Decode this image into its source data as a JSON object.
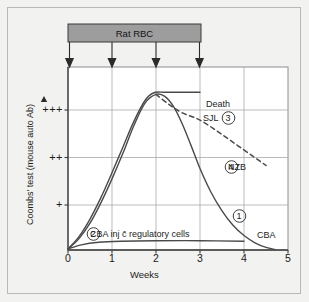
{
  "figure": {
    "background_color": "#f2f2f0",
    "border_color": "#b8b8b6",
    "line_color": "#4a4a4a",
    "grid_color": "#a9a9a9",
    "bar_fill": "#9d9d9d",
    "bar_stroke": "#3a3a3a"
  },
  "treatment_bar": {
    "label": "Rat RBC",
    "start_week": 0,
    "end_week": 3,
    "arrow_weeks": [
      0,
      1,
      2,
      3
    ],
    "arrow_count": 4
  },
  "axes": {
    "y_title": "Coombs' test (mouse auto Ab)",
    "y_arrow_icon": "up-arrow-icon",
    "y_ticks": [
      "+++",
      "++",
      "+"
    ],
    "y_tick_values": [
      3,
      2,
      1
    ],
    "x_title": "Weeks",
    "x_ticks": [
      "0",
      "1",
      "2",
      "3",
      "4",
      "5"
    ],
    "x_tick_values": [
      0,
      1,
      2,
      3,
      4,
      5
    ]
  },
  "annotations": {
    "death": "Death",
    "sjl": "SJL",
    "sjl_number": "3",
    "nzb": "NZB",
    "nzb_number": "4",
    "cba": "CBA",
    "curve1_number": "1",
    "cba_regulatory": "CBA inj c̄ regulatory cells",
    "cba_regulatory_number": "2"
  },
  "chart_data": {
    "type": "line",
    "title": "",
    "xlabel": "Weeks",
    "ylabel": "Coombs' test (mouse auto Ab)",
    "xlim": [
      0,
      5
    ],
    "ylim": [
      0,
      3.55
    ],
    "grid": true,
    "legend": "inline-annotations",
    "x_tick_labels": [
      "0",
      "1",
      "2",
      "3",
      "4",
      "5"
    ],
    "y_tick_labels": [
      "+",
      "++",
      "+++"
    ],
    "y_tick_positions": [
      1,
      2,
      3
    ],
    "series": [
      {
        "name": "CBA",
        "number": "1",
        "style": "solid",
        "label_position": "right",
        "points": [
          [
            0.0,
            0.02
          ],
          [
            0.25,
            0.22
          ],
          [
            0.5,
            0.52
          ],
          [
            0.75,
            0.92
          ],
          [
            1.0,
            1.38
          ],
          [
            1.25,
            1.88
          ],
          [
            1.5,
            2.42
          ],
          [
            1.75,
            2.85
          ],
          [
            2.0,
            3.02
          ],
          [
            2.2,
            2.98
          ],
          [
            2.4,
            2.78
          ],
          [
            2.6,
            2.44
          ],
          [
            2.8,
            2.02
          ],
          [
            3.0,
            1.58
          ],
          [
            3.25,
            1.12
          ],
          [
            3.5,
            0.76
          ],
          [
            3.75,
            0.48
          ],
          [
            4.0,
            0.28
          ],
          [
            4.25,
            0.14
          ],
          [
            4.5,
            0.05
          ],
          [
            4.7,
            0.01
          ]
        ]
      },
      {
        "name": "SJL",
        "number": "3",
        "style": "solid",
        "note": "Death",
        "points": [
          [
            0.0,
            0.02
          ],
          [
            0.25,
            0.26
          ],
          [
            0.5,
            0.6
          ],
          [
            0.75,
            1.02
          ],
          [
            1.0,
            1.5
          ],
          [
            1.25,
            2.0
          ],
          [
            1.5,
            2.5
          ],
          [
            1.75,
            2.9
          ],
          [
            1.95,
            3.05
          ],
          [
            2.2,
            3.06
          ],
          [
            2.6,
            3.06
          ],
          [
            3.0,
            3.06
          ]
        ]
      },
      {
        "name": "NZB",
        "number": "4",
        "style": "dashed",
        "points": [
          [
            2.0,
            3.02
          ],
          [
            2.3,
            2.82
          ],
          [
            2.6,
            2.66
          ],
          [
            3.0,
            2.52
          ],
          [
            3.4,
            2.3
          ],
          [
            3.8,
            2.06
          ],
          [
            4.2,
            1.82
          ],
          [
            4.5,
            1.64
          ]
        ]
      },
      {
        "name": "CBA inj c̄ regulatory cells",
        "number": "2",
        "style": "solid",
        "points": [
          [
            0.0,
            0.02
          ],
          [
            0.3,
            0.1
          ],
          [
            0.7,
            0.15
          ],
          [
            1.2,
            0.17
          ],
          [
            2.0,
            0.18
          ],
          [
            3.0,
            0.18
          ],
          [
            4.0,
            0.17
          ]
        ]
      }
    ]
  }
}
